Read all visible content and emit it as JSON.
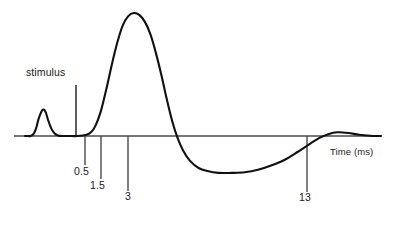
{
  "figure": {
    "background_color": "#ffffff",
    "line_color": "#111111",
    "axis_color": "#444444",
    "stimulus_label": "stimulus",
    "axis_title_x": "Time (ms)"
  },
  "chart_data": {
    "type": "line",
    "title": "",
    "subtitle": "",
    "xlabel": "Time (ms)",
    "ylabel": "",
    "grid": false,
    "legend": null,
    "xlim": [
      0,
      16.2
    ],
    "ylim": [
      -0.35,
      1.05
    ],
    "x_tick_labels": [
      "0.5",
      "1.5",
      "3",
      "13"
    ],
    "x_tick_values": [
      0.5,
      1.5,
      3,
      13
    ],
    "annotations": [
      {
        "text": "stimulus",
        "x": 0,
        "y": 0.46,
        "kind": "stimulus-artifact-marker"
      }
    ],
    "series": [
      {
        "name": "compound action potential",
        "x": [
          0,
          0.1,
          0.25,
          0.4,
          0.5,
          0.62,
          0.75,
          0.85,
          0.95,
          1.05,
          1.2,
          1.35,
          1.5,
          1.7,
          2.0,
          2.4,
          2.8,
          3.0,
          3.2,
          3.45,
          3.7,
          3.95,
          4.2,
          4.45,
          4.7,
          4.95,
          5.2,
          5.45,
          5.7,
          5.95,
          6.2,
          6.45,
          6.7,
          6.95,
          7.2,
          7.5,
          7.9,
          8.3,
          8.8,
          9.4,
          10.0,
          10.6,
          11.2,
          11.8,
          12.4,
          13.0,
          13.4,
          13.8,
          14.2,
          14.7,
          15.2,
          15.7,
          16.2
        ],
        "y": [
          0,
          0,
          0,
          0.02,
          0.06,
          0.14,
          0.2,
          0.215,
          0.19,
          0.13,
          0.06,
          0.02,
          0.005,
          0,
          0,
          0,
          0.01,
          0.03,
          0.08,
          0.2,
          0.38,
          0.58,
          0.76,
          0.9,
          0.975,
          1.0,
          0.985,
          0.93,
          0.83,
          0.68,
          0.5,
          0.3,
          0.12,
          -0.02,
          -0.12,
          -0.2,
          -0.26,
          -0.285,
          -0.3,
          -0.3,
          -0.295,
          -0.275,
          -0.24,
          -0.195,
          -0.13,
          -0.06,
          -0.015,
          0.015,
          0.03,
          0.025,
          0.01,
          0.002,
          0
        ]
      }
    ]
  },
  "geometry": {
    "baseline_y": 136,
    "axis_x_start": 14,
    "axis_x_end": 381,
    "stimulus_x": 76,
    "stimulus_top_y": 85,
    "ticks": [
      {
        "label": "0.5",
        "x": 85,
        "bottom_y": 165
      },
      {
        "label": "1.5",
        "x": 101,
        "bottom_y": 179
      },
      {
        "label": "3",
        "x": 128,
        "bottom_y": 191
      },
      {
        "label": "13",
        "x": 307,
        "bottom_y": 192
      }
    ]
  }
}
